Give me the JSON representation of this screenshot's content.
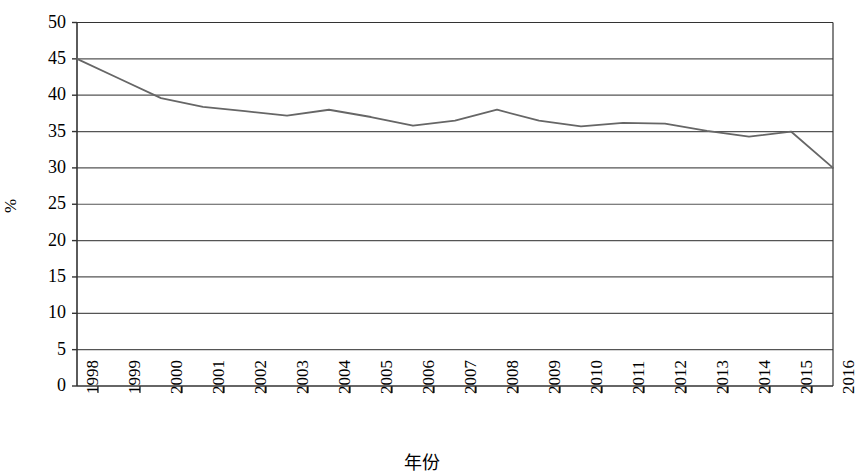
{
  "chart_data": {
    "type": "line",
    "title": "",
    "xlabel": "年份",
    "ylabel": "%",
    "categories": [
      "1998",
      "1999",
      "2000",
      "2001",
      "2002",
      "2003",
      "2004",
      "2005",
      "2006",
      "2007",
      "2008",
      "2009",
      "2010",
      "2011",
      "2012",
      "2013",
      "2014",
      "2015",
      "2016"
    ],
    "values": [
      45.0,
      42.3,
      39.6,
      38.4,
      37.8,
      37.2,
      38.0,
      37.0,
      35.8,
      36.5,
      38.0,
      36.5,
      35.7,
      36.2,
      36.1,
      35.1,
      34.3,
      35.0,
      30.0
    ],
    "series": [
      {
        "name": "",
        "values": [
          45.0,
          42.3,
          39.6,
          38.4,
          37.8,
          37.2,
          38.0,
          37.0,
          35.8,
          36.5,
          38.0,
          36.5,
          35.7,
          36.2,
          36.1,
          35.1,
          34.3,
          35.0,
          30.0
        ]
      }
    ],
    "ylim": [
      0,
      50
    ],
    "ytick_labels": [
      "0",
      "5",
      "10",
      "15",
      "20",
      "25",
      "30",
      "35",
      "40",
      "45",
      "50"
    ],
    "ytick_values": [
      0,
      5,
      10,
      15,
      20,
      25,
      30,
      35,
      40,
      45,
      50
    ],
    "grid": "horizontal",
    "legend": "none",
    "line_color": "#666666",
    "grid_color": "#555555",
    "axis_color": "#333333",
    "background_color": "#ffffff",
    "markers": false
  }
}
